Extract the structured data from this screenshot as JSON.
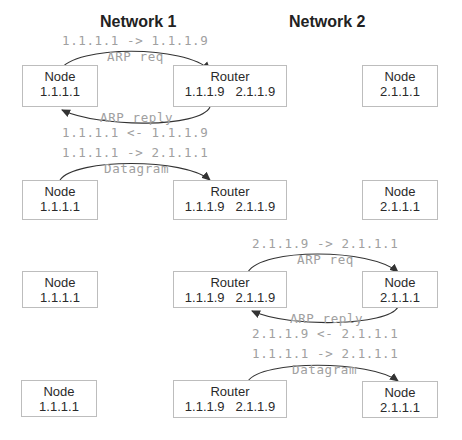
{
  "titles": {
    "network1": "Network 1",
    "network2": "Network 2"
  },
  "rows": [
    {
      "node1": {
        "name": "Node",
        "ip": "1.1.1.1"
      },
      "router": {
        "name": "Router",
        "ip1": "1.1.1.9",
        "ip2": "2.1.1.9"
      },
      "node2": {
        "name": "Node",
        "ip": "2.1.1.1"
      },
      "top_addr": "1.1.1.1 -> 1.1.1.9",
      "top_label": "ARP req",
      "bottom_label": "ARP reply",
      "bottom_addr": "1.1.1.1 <- 1.1.1.9"
    },
    {
      "node1": {
        "name": "Node",
        "ip": "1.1.1.1"
      },
      "router": {
        "name": "Router",
        "ip1": "1.1.1.9",
        "ip2": "2.1.1.9"
      },
      "node2": {
        "name": "Node",
        "ip": "2.1.1.1"
      },
      "top_addr": "1.1.1.1 -> 2.1.1.1",
      "top_label": "Datagram"
    },
    {
      "node1": {
        "name": "Node",
        "ip": "1.1.1.1"
      },
      "router": {
        "name": "Router",
        "ip1": "1.1.1.9",
        "ip2": "2.1.1.9"
      },
      "node2": {
        "name": "Node",
        "ip": "2.1.1.1"
      },
      "top_addr": "2.1.1.9 -> 2.1.1.1",
      "top_label": "ARP req",
      "bottom_label": "ARP reply",
      "bottom_addr": "2.1.1.9 <- 2.1.1.1"
    },
    {
      "node1": {
        "name": "Node",
        "ip": "1.1.1.1"
      },
      "router": {
        "name": "Router",
        "ip1": "1.1.1.9",
        "ip2": "2.1.1.9"
      },
      "node2": {
        "name": "Node",
        "ip": "2.1.1.1"
      },
      "top_addr": "1.1.1.1 -> 2.1.1.1",
      "top_label": "Datagram"
    }
  ],
  "colors": {
    "box_border": "#bdbdbd",
    "annotation_text": "#a0a0a0",
    "arrow": "#333333",
    "title": "#222222"
  }
}
